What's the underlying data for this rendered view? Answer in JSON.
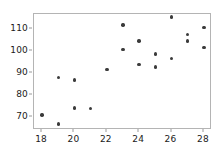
{
  "chart_data": {
    "type": "scatter",
    "title": "",
    "subtitle": "",
    "xlabel": "",
    "ylabel": "",
    "xlim": [
      17.5,
      28.5
    ],
    "ylim": [
      64,
      117
    ],
    "grid": false,
    "legend": null,
    "marker": {
      "shape": "circle",
      "color": "#3b3b3b",
      "size_px": 3.4
    },
    "frame_color": "#b4b4b4",
    "background": "#ffffff",
    "xticks": [
      18,
      20,
      22,
      24,
      26,
      28
    ],
    "xtick_labels": [
      "18",
      "20",
      "22",
      "24",
      "26",
      "28"
    ],
    "yticks": [
      70,
      80,
      90,
      100,
      110
    ],
    "ytick_labels": [
      "70",
      "80",
      "90",
      "100",
      "110"
    ],
    "series": [
      {
        "name": "observations",
        "points": [
          {
            "x": 18,
            "y": 70.8
          },
          {
            "x": 19,
            "y": 66.8
          },
          {
            "x": 19,
            "y": 88.0
          },
          {
            "x": 20,
            "y": 86.8
          },
          {
            "x": 20,
            "y": 74.0
          },
          {
            "x": 21,
            "y": 73.9
          },
          {
            "x": 22,
            "y": 91.7
          },
          {
            "x": 23,
            "y": 111.9
          },
          {
            "x": 23,
            "y": 100.9
          },
          {
            "x": 24,
            "y": 104.7
          },
          {
            "x": 24,
            "y": 93.8
          },
          {
            "x": 25,
            "y": 98.8
          },
          {
            "x": 25,
            "y": 92.7
          },
          {
            "x": 26,
            "y": 115.7
          },
          {
            "x": 26,
            "y": 96.7
          },
          {
            "x": 27,
            "y": 107.6
          },
          {
            "x": 27,
            "y": 104.6
          },
          {
            "x": 28,
            "y": 110.7
          },
          {
            "x": 28,
            "y": 101.7
          }
        ]
      }
    ]
  }
}
